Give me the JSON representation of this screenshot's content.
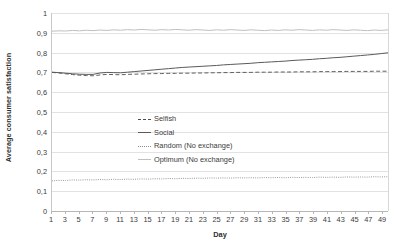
{
  "chart_data": {
    "type": "line",
    "title": "",
    "xlabel": "Day",
    "ylabel": "Average consumer satisfaction",
    "xlim": [
      1,
      50
    ],
    "ylim": [
      0,
      1
    ],
    "grid": true,
    "legend_position": "center",
    "y_ticks": [
      "0",
      "0,1",
      "0,2",
      "0,3",
      "0,4",
      "0,5",
      "0,6",
      "0,7",
      "0,8",
      "0,9",
      "1"
    ],
    "y_tick_values": [
      0,
      0.1,
      0.2,
      0.3,
      0.4,
      0.5,
      0.6,
      0.7,
      0.8,
      0.9,
      1
    ],
    "x_ticks": [
      "1",
      "3",
      "5",
      "7",
      "9",
      "11",
      "13",
      "15",
      "17",
      "19",
      "21",
      "23",
      "25",
      "27",
      "29",
      "31",
      "33",
      "35",
      "37",
      "39",
      "41",
      "43",
      "45",
      "47",
      "49"
    ],
    "x_tick_values": [
      1,
      3,
      5,
      7,
      9,
      11,
      13,
      15,
      17,
      19,
      21,
      23,
      25,
      27,
      29,
      31,
      33,
      35,
      37,
      39,
      41,
      43,
      45,
      47,
      49
    ],
    "x": [
      1,
      2,
      3,
      4,
      5,
      6,
      7,
      8,
      9,
      10,
      11,
      12,
      13,
      14,
      15,
      16,
      17,
      18,
      19,
      20,
      21,
      22,
      23,
      24,
      25,
      26,
      27,
      28,
      29,
      30,
      31,
      32,
      33,
      34,
      35,
      36,
      37,
      38,
      39,
      40,
      41,
      42,
      43,
      44,
      45,
      46,
      47,
      48,
      49,
      50
    ],
    "series": [
      {
        "name": "Selfish",
        "style": "dashed",
        "color": "#4d4d4d",
        "values": [
          0.7,
          0.697,
          0.693,
          0.689,
          0.686,
          0.684,
          0.683,
          0.687,
          0.69,
          0.689,
          0.688,
          0.69,
          0.691,
          0.692,
          0.693,
          0.694,
          0.694,
          0.695,
          0.695,
          0.696,
          0.696,
          0.697,
          0.697,
          0.698,
          0.698,
          0.699,
          0.699,
          0.7,
          0.7,
          0.7,
          0.701,
          0.701,
          0.701,
          0.702,
          0.702,
          0.702,
          0.703,
          0.703,
          0.703,
          0.704,
          0.704,
          0.704,
          0.704,
          0.705,
          0.705,
          0.705,
          0.705,
          0.706,
          0.706,
          0.706
        ]
      },
      {
        "name": "Social",
        "style": "solid",
        "color": "#595959",
        "values": [
          0.701,
          0.699,
          0.696,
          0.693,
          0.691,
          0.69,
          0.69,
          0.697,
          0.7,
          0.699,
          0.698,
          0.701,
          0.704,
          0.707,
          0.71,
          0.713,
          0.716,
          0.719,
          0.722,
          0.725,
          0.727,
          0.729,
          0.731,
          0.733,
          0.735,
          0.738,
          0.74,
          0.742,
          0.744,
          0.746,
          0.749,
          0.751,
          0.753,
          0.755,
          0.757,
          0.76,
          0.762,
          0.764,
          0.766,
          0.769,
          0.771,
          0.774,
          0.776,
          0.779,
          0.782,
          0.785,
          0.788,
          0.791,
          0.795,
          0.799
        ]
      },
      {
        "name": "Random (No exchange)",
        "style": "dotted",
        "color": "#8c8c8c",
        "values": [
          0.152,
          0.155,
          0.154,
          0.157,
          0.156,
          0.158,
          0.157,
          0.159,
          0.158,
          0.16,
          0.159,
          0.161,
          0.16,
          0.162,
          0.161,
          0.163,
          0.162,
          0.164,
          0.163,
          0.165,
          0.164,
          0.166,
          0.165,
          0.167,
          0.166,
          0.167,
          0.166,
          0.168,
          0.167,
          0.168,
          0.167,
          0.169,
          0.168,
          0.169,
          0.168,
          0.17,
          0.169,
          0.17,
          0.169,
          0.171,
          0.17,
          0.171,
          0.17,
          0.172,
          0.171,
          0.172,
          0.171,
          0.173,
          0.172,
          0.173
        ]
      },
      {
        "name": "Optimum (No exchange)",
        "style": "solid-light",
        "color": "#bfbfbf",
        "values": [
          0.908,
          0.91,
          0.909,
          0.912,
          0.91,
          0.913,
          0.911,
          0.914,
          0.912,
          0.915,
          0.913,
          0.916,
          0.914,
          0.917,
          0.915,
          0.913,
          0.916,
          0.914,
          0.917,
          0.915,
          0.913,
          0.916,
          0.914,
          0.912,
          0.915,
          0.913,
          0.916,
          0.914,
          0.912,
          0.915,
          0.913,
          0.911,
          0.914,
          0.912,
          0.915,
          0.913,
          0.916,
          0.914,
          0.912,
          0.915,
          0.913,
          0.916,
          0.914,
          0.912,
          0.915,
          0.913,
          0.911,
          0.914,
          0.912,
          0.915
        ]
      }
    ]
  },
  "axes": {
    "y_title": "Average consumer satisfaction",
    "x_title": "Day"
  },
  "legend": {
    "items": [
      {
        "label": "Selfish"
      },
      {
        "label": "Social"
      },
      {
        "label": "Random (No exchange)"
      },
      {
        "label": "Optimum (No exchange)"
      }
    ]
  },
  "colors": {
    "grid": "#e2e2e2",
    "axis": "#b6b6b6",
    "text": "#3b3b3b",
    "selfish": "#4d4d4d",
    "social": "#595959",
    "random": "#8c8c8c",
    "optimum": "#bfbfbf"
  }
}
